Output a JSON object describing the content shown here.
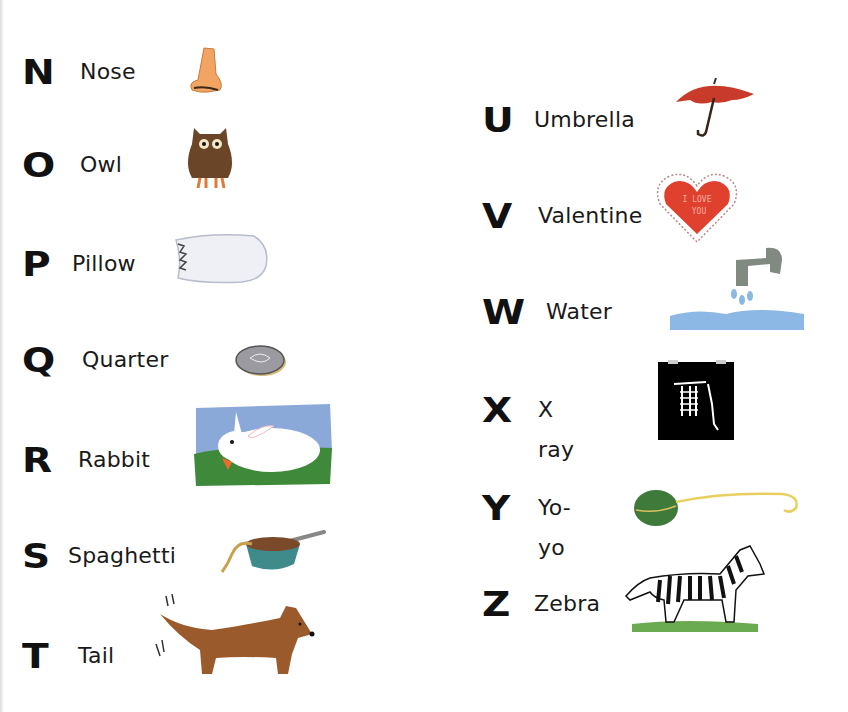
{
  "page": {
    "left_column": [
      {
        "letter": "N",
        "word": "Nose",
        "icon": "nose-icon"
      },
      {
        "letter": "O",
        "word": "Owl",
        "icon": "owl-icon"
      },
      {
        "letter": "P",
        "word": "Pillow",
        "icon": "pillow-icon"
      },
      {
        "letter": "Q",
        "word": "Quarter",
        "icon": "coin-icon"
      },
      {
        "letter": "R",
        "word": "Rabbit",
        "icon": "rabbit-icon"
      },
      {
        "letter": "S",
        "word": "Spaghetti",
        "icon": "spaghetti-bowl-icon"
      },
      {
        "letter": "T",
        "word": "Tail",
        "icon": "dog-icon"
      }
    ],
    "right_column": [
      {
        "letter": "U",
        "word": "Umbrella",
        "icon": "umbrella-icon"
      },
      {
        "letter": "V",
        "word": "Valentine",
        "icon": "heart-icon"
      },
      {
        "letter": "W",
        "word": "Water",
        "icon": "faucet-icon"
      },
      {
        "letter": "X",
        "word": "X ray",
        "icon": "xray-icon"
      },
      {
        "letter": "Y",
        "word": "Yo-yo",
        "icon": "yoyo-icon"
      },
      {
        "letter": "Z",
        "word": "Zebra",
        "icon": "zebra-icon"
      }
    ],
    "valentine_text": [
      "I LOVE",
      "YOU"
    ],
    "colors": {
      "text": "#111111",
      "nose": "#f0a060",
      "owl": "#6b4528",
      "umbrella": "#c83a2a",
      "heart": "#e0402e",
      "water": "#8cb8e6",
      "grass": "#3f8a3a",
      "sky": "#8aa8d8",
      "dog": "#9a5a2c",
      "yoyo": "#3f7a3a"
    }
  }
}
